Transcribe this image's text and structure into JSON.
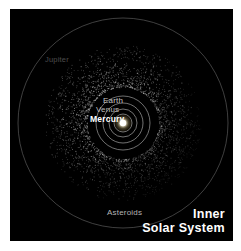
{
  "figure": {
    "title_line1": "Inner",
    "title_line2": "Solar System",
    "background_color": "#000000",
    "page_color": "#ffffff",
    "title_color": "#ffffff"
  },
  "labels": {
    "jupiter": "Jupiter",
    "earth": "Earth",
    "venus": "Venus",
    "mercury": "Mercury",
    "asteroids": "Asteroids"
  },
  "label_colors": {
    "jupiter": "#4d4d4d",
    "earth": "#c6c6c6",
    "venus": "#bdbdbd",
    "mercury": "#ffffff",
    "asteroids": "#b4b4b4"
  },
  "chart_data": {
    "type": "scatter",
    "title": "Inner Solar System",
    "xlabel": "",
    "ylabel": "",
    "grid": false,
    "legend": "none",
    "projection": "top-down ecliptic plane, Sun at center",
    "center": {
      "x": 113,
      "y": 114
    },
    "sun": {
      "label": "Sun",
      "radius_px": 3.2,
      "color": "#ffffff",
      "glow_color": "#fff6cf"
    },
    "orbits": [
      {
        "name": "Mercury",
        "radius_px": 9,
        "color": "#8f8f8f"
      },
      {
        "name": "Venus",
        "radius_px": 14,
        "color": "#8f8f8f"
      },
      {
        "name": "Earth",
        "radius_px": 20,
        "color": "#8f8f8f"
      },
      {
        "name": "Mars",
        "radius_px": 27,
        "color": "#8a8a8a"
      },
      {
        "name": "Jupiter",
        "radius_px": 105,
        "color": "#6b6b6b"
      }
    ],
    "asteroid_belt": {
      "name": "Asteroids",
      "inner_radius_px": 36,
      "outer_radius_px": 78,
      "point_count": 2600,
      "point_color": "#d9d9d9",
      "density_note": "denser and brighter toward inner edge and upper-left quadrant"
    },
    "axis_ranges": {
      "xlim": [
        -112,
        112
      ],
      "ylim": [
        -116,
        116
      ]
    }
  }
}
